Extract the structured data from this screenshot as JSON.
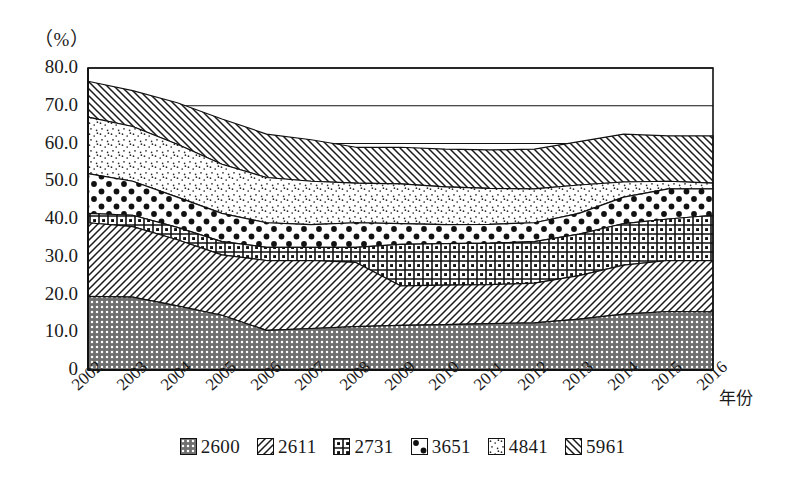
{
  "chart_data": {
    "type": "area",
    "title": "",
    "subtitle": "",
    "xlabel": "年份",
    "ylabel": "（%）",
    "stacked": true,
    "grid": true,
    "legend_position": "bottom",
    "ylim": [
      0,
      80
    ],
    "yticks": [
      "0",
      "10.0",
      "20.0",
      "30.0",
      "40.0",
      "50.0",
      "60.0",
      "70.0",
      "80.0"
    ],
    "ytick_values": [
      0,
      10,
      20,
      30,
      40,
      50,
      60,
      70,
      80
    ],
    "gridline_values": [
      60,
      70,
      80
    ],
    "categories": [
      "2002",
      "2003",
      "2004",
      "2005",
      "2006",
      "2007",
      "2008",
      "2009",
      "2010",
      "2011",
      "2012",
      "2013",
      "2014",
      "2015",
      "2016"
    ],
    "x": [
      2002,
      2003,
      2004,
      2005,
      2006,
      2007,
      2008,
      2009,
      2010,
      2011,
      2012,
      2013,
      2014,
      2015,
      2016
    ],
    "series": [
      {
        "name": "2600",
        "pattern": "checkerboard-dark",
        "values": [
          19.5,
          19.3,
          17.0,
          14.5,
          10.5,
          11.0,
          11.5,
          11.8,
          12.0,
          12.3,
          12.5,
          13.5,
          14.8,
          15.5,
          15.4
        ]
      },
      {
        "name": "2611",
        "pattern": "diagonal-hatch-up",
        "values": [
          19.5,
          18.7,
          17.5,
          16.0,
          18.5,
          18.0,
          17.0,
          10.5,
          10.5,
          10.3,
          10.5,
          11.5,
          13.0,
          13.5,
          13.6
        ]
      },
      {
        "name": "2731",
        "pattern": "grid-squares",
        "values": [
          2.5,
          3.0,
          3.3,
          3.5,
          3.5,
          3.5,
          4.0,
          11.0,
          11.0,
          11.0,
          11.0,
          11.0,
          11.0,
          11.0,
          12.0
        ]
      },
      {
        "name": "3651",
        "pattern": "polka-dots",
        "values": [
          10.5,
          9.0,
          8.0,
          7.5,
          6.5,
          6.0,
          6.5,
          5.5,
          5.0,
          5.0,
          5.0,
          5.5,
          7.0,
          8.0,
          7.0
        ]
      },
      {
        "name": "4841",
        "pattern": "fine-stipple",
        "values": [
          15.0,
          14.5,
          14.0,
          13.0,
          12.0,
          11.5,
          10.5,
          10.5,
          10.0,
          9.5,
          9.0,
          7.5,
          4.0,
          2.0,
          1.5
        ]
      },
      {
        "name": "5961",
        "pattern": "diagonal-hatch-down",
        "values": [
          9.5,
          9.5,
          11.0,
          12.0,
          11.5,
          11.0,
          9.5,
          9.7,
          10.0,
          10.2,
          10.5,
          11.5,
          12.7,
          12.0,
          12.5
        ]
      }
    ],
    "cumulative_tops": {
      "2600": [
        19.5,
        19.3,
        17.0,
        14.5,
        10.5,
        11.0,
        11.5,
        11.8,
        12.0,
        12.3,
        12.5,
        13.5,
        14.8,
        15.5,
        15.4
      ],
      "2611": [
        39.0,
        38.0,
        34.5,
        30.5,
        29.0,
        29.0,
        28.5,
        22.3,
        22.5,
        22.6,
        23.0,
        25.0,
        27.8,
        29.0,
        29.0
      ],
      "2731": [
        41.5,
        41.0,
        37.8,
        34.0,
        32.5,
        32.5,
        32.5,
        33.3,
        33.5,
        33.6,
        34.0,
        36.0,
        38.8,
        40.0,
        41.0
      ],
      "3651": [
        52.0,
        50.0,
        45.8,
        41.5,
        39.0,
        38.5,
        39.0,
        38.8,
        38.5,
        38.6,
        39.0,
        41.5,
        45.8,
        48.0,
        48.0
      ],
      "4841": [
        67.0,
        64.5,
        59.8,
        54.5,
        51.0,
        50.0,
        49.5,
        49.3,
        48.5,
        48.1,
        48.0,
        49.0,
        49.8,
        50.0,
        49.5
      ],
      "5961": [
        76.5,
        74.0,
        70.8,
        66.5,
        62.5,
        61.0,
        59.0,
        59.0,
        58.5,
        58.3,
        58.5,
        60.5,
        62.5,
        62.0,
        62.0
      ]
    }
  },
  "axis": {
    "unit_label": "（%）",
    "x_title": "年份"
  },
  "legend": {
    "items": [
      {
        "label": "2600",
        "pattern": "checkerboard-dark"
      },
      {
        "label": "2611",
        "pattern": "diagonal-hatch-up"
      },
      {
        "label": "2731",
        "pattern": "grid-squares"
      },
      {
        "label": "3651",
        "pattern": "polka-dots"
      },
      {
        "label": "4841",
        "pattern": "fine-stipple"
      },
      {
        "label": "5961",
        "pattern": "diagonal-hatch-down"
      }
    ]
  },
  "colors": {
    "ink": "#111111",
    "background": "#ffffff"
  }
}
